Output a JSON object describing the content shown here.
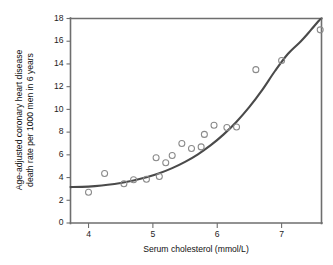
{
  "chart_data": {
    "type": "scatter",
    "title": "",
    "xlabel": "Serum cholesterol (mmol/L)",
    "ylabel": "Age-adjusted coronary heart disease\ndeath rate per 1000 men in 6 years",
    "ylabel_line1": "Age-adjusted coronary heart disease",
    "ylabel_line2": "death rate per 1000 men in 6 years",
    "xlim": [
      3.72,
      7.62
    ],
    "ylim": [
      0,
      18
    ],
    "xticks": [
      4,
      5,
      6,
      7
    ],
    "xticklabels": [
      "4",
      "5",
      "6",
      "7"
    ],
    "yticks": [
      0,
      2,
      4,
      6,
      8,
      10,
      12,
      14,
      16,
      18
    ],
    "yticklabels": [
      "0",
      "2",
      "4",
      "6",
      "8",
      "10",
      "12",
      "14",
      "16",
      "18"
    ],
    "grid": false,
    "legend": null,
    "marker_style": "open-circle",
    "marker_color": "#8a8a8a",
    "curve_color": "#4a4a4a",
    "axis_color": "#6e6e6e",
    "background_color": "#ffffff",
    "points": [
      {
        "x": 4.0,
        "y": 2.7
      },
      {
        "x": 4.25,
        "y": 4.35
      },
      {
        "x": 4.55,
        "y": 3.45
      },
      {
        "x": 4.7,
        "y": 3.8
      },
      {
        "x": 4.9,
        "y": 3.85
      },
      {
        "x": 5.05,
        "y": 5.75
      },
      {
        "x": 5.1,
        "y": 4.1
      },
      {
        "x": 5.2,
        "y": 5.3
      },
      {
        "x": 5.3,
        "y": 5.95
      },
      {
        "x": 5.45,
        "y": 7.0
      },
      {
        "x": 5.6,
        "y": 6.55
      },
      {
        "x": 5.75,
        "y": 6.7
      },
      {
        "x": 5.8,
        "y": 7.8
      },
      {
        "x": 5.95,
        "y": 8.6
      },
      {
        "x": 6.15,
        "y": 8.4
      },
      {
        "x": 6.3,
        "y": 8.45
      },
      {
        "x": 6.6,
        "y": 13.5
      },
      {
        "x": 7.0,
        "y": 14.3
      },
      {
        "x": 7.6,
        "y": 17.0
      }
    ],
    "fit_curve": {
      "name": "fitted exponential trend",
      "points": [
        {
          "x": 3.72,
          "y": 3.16
        },
        {
          "x": 3.9,
          "y": 3.18
        },
        {
          "x": 4.1,
          "y": 3.25
        },
        {
          "x": 4.3,
          "y": 3.36
        },
        {
          "x": 4.5,
          "y": 3.52
        },
        {
          "x": 4.7,
          "y": 3.74
        },
        {
          "x": 4.9,
          "y": 4.02
        },
        {
          "x": 5.1,
          "y": 4.38
        },
        {
          "x": 5.3,
          "y": 4.83
        },
        {
          "x": 5.5,
          "y": 5.38
        },
        {
          "x": 5.7,
          "y": 6.05
        },
        {
          "x": 5.9,
          "y": 6.85
        },
        {
          "x": 6.1,
          "y": 7.8
        },
        {
          "x": 6.3,
          "y": 8.92
        },
        {
          "x": 6.5,
          "y": 10.22
        },
        {
          "x": 6.7,
          "y": 11.72
        },
        {
          "x": 6.9,
          "y": 13.4
        },
        {
          "x": 7.1,
          "y": 14.9
        },
        {
          "x": 7.3,
          "y": 16.0
        },
        {
          "x": 7.45,
          "y": 16.95
        },
        {
          "x": 7.6,
          "y": 17.95
        }
      ]
    }
  }
}
